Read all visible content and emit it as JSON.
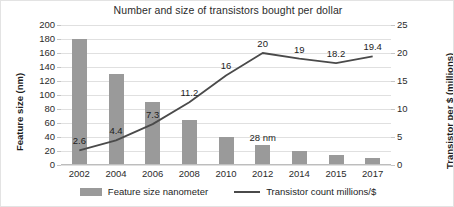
{
  "chart_data": {
    "type": "bar",
    "title": "Number and size of transistors bought per dollar",
    "categories": [
      "2002",
      "2004",
      "2006",
      "2008",
      "2010",
      "2012",
      "2014",
      "2015",
      "2017"
    ],
    "xlabel": "",
    "ylabel": "Feature size (nm)",
    "ylabel_secondary": "Transistor per $ (millions)",
    "ylim": [
      0,
      200
    ],
    "ylim_secondary": [
      0,
      25
    ],
    "yticks": [
      "200",
      "180",
      "160",
      "140",
      "120",
      "100",
      "80",
      "60",
      "40",
      "20",
      "0"
    ],
    "yticks_secondary": [
      "25",
      "20",
      "15",
      "10",
      "5",
      "0"
    ],
    "grid": true,
    "legend_position": "bottom",
    "series": [
      {
        "name": "Feature size nanometer",
        "type": "bar",
        "axis": "left",
        "color": "#9a9a9a",
        "values": [
          180,
          130,
          90,
          65,
          40,
          28,
          20,
          14,
          10
        ],
        "point_labels": [
          "",
          "",
          "",
          "",
          "",
          "28 nm",
          "",
          "",
          ""
        ]
      },
      {
        "name": "Transistor count millions/$",
        "type": "line",
        "axis": "right",
        "color": "#4a4a4a",
        "values": [
          2.6,
          4.4,
          7.3,
          11.2,
          16,
          20,
          19,
          18.2,
          19.4
        ],
        "point_labels": [
          "2.6",
          "4.4",
          "7.3",
          "11.2",
          "16",
          "20",
          "19",
          "18.2",
          "19.4"
        ]
      }
    ]
  },
  "legend": {
    "entries": [
      {
        "label": "Feature size nanometer",
        "marker": "bar-swatch"
      },
      {
        "label": "Transistor count millions/$",
        "marker": "line-swatch"
      }
    ]
  }
}
